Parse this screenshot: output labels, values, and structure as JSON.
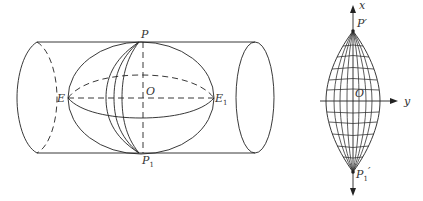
{
  "figure": {
    "left": {
      "title": "Sphere inscribed in cylinder (transverse cylindrical projection)",
      "labels": {
        "top_pole": "P",
        "bottom_pole": "P",
        "bottom_pole_sub": "1",
        "left_point": "E",
        "right_point": "E",
        "right_point_sub": "1",
        "center": "O"
      }
    },
    "right": {
      "title": "Projected graticule (lens-shaped grid)",
      "labels": {
        "top_pole": "P′",
        "bottom_pole": "P",
        "bottom_pole_sub": "1",
        "bottom_pole_prime": "′",
        "center": "O",
        "x_axis": "x",
        "y_axis": "y"
      }
    },
    "colors": {
      "line": "#222222",
      "text": "#333333",
      "background": "#ffffff"
    }
  }
}
